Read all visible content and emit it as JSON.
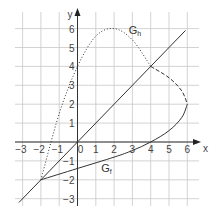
{
  "chart_data": {
    "type": "line",
    "title": "",
    "xlabel": "x",
    "ylabel": "y",
    "xlim": [
      -3.3,
      6.6
    ],
    "ylim": [
      -3.4,
      6.9
    ],
    "grid": true,
    "x_ticks": [
      -3,
      -2,
      -1,
      0,
      1,
      2,
      3,
      4,
      5,
      6
    ],
    "y_ticks": [
      -3,
      -2,
      -1,
      1,
      2,
      3,
      4,
      5,
      6
    ],
    "x_tick_labels": [
      "−3",
      "−2",
      "−1",
      "0",
      "1",
      "2",
      "3",
      "4",
      "5",
      "6"
    ],
    "y_tick_labels": [
      "−3",
      "−2",
      "−1",
      "1",
      "2",
      "3",
      "4",
      "5",
      "6"
    ],
    "series": [
      {
        "name": "y = x",
        "style": "solid",
        "points": [
          [
            -3.2,
            -3.2
          ],
          [
            5.9,
            5.9
          ]
        ]
      },
      {
        "name": "G_f",
        "label": "G",
        "label_sub": "f",
        "style": "solid",
        "points": [
          [
            -2,
            -2
          ],
          [
            0,
            -1.4
          ],
          [
            2,
            -0.8
          ],
          [
            3,
            -0.45
          ],
          [
            4,
            0
          ],
          [
            5,
            0.6
          ],
          [
            5.7,
            1.3
          ],
          [
            6,
            2
          ]
        ]
      },
      {
        "name": "G_h",
        "label": "G",
        "label_sub": "h",
        "style": "dotted",
        "points": [
          [
            -2,
            -2
          ],
          [
            -1,
            1.5
          ],
          [
            0,
            4
          ],
          [
            1,
            5.6
          ],
          [
            2,
            6
          ],
          [
            3,
            5.4
          ],
          [
            4,
            4
          ]
        ]
      },
      {
        "name": "G_h (continuation)",
        "style": "dashed",
        "points": [
          [
            4,
            4
          ],
          [
            5,
            3.4
          ],
          [
            5.7,
            2.7
          ],
          [
            6,
            2
          ]
        ]
      }
    ],
    "annotations": [
      {
        "text": "G_h",
        "x": 2.8,
        "y": 5.7
      },
      {
        "text": "G_f",
        "x": 1.3,
        "y": -1.6
      }
    ],
    "points_of_interest": [
      [
        -2,
        -2
      ],
      [
        4,
        4
      ],
      [
        4,
        0
      ],
      [
        6,
        2
      ]
    ]
  },
  "labels": {
    "x_axis": "x",
    "y_axis": "y",
    "g_h": "G",
    "g_h_sub": "h",
    "g_f": "G",
    "g_f_sub": "f"
  }
}
